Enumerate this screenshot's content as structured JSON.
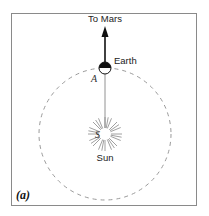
{
  "figure": {
    "panel_label": "(a)",
    "direction_label": "To Mars",
    "earth_label": "Earth",
    "sun_label": "Sun",
    "point_a_label": "A",
    "point_s_label": "S"
  },
  "colors": {
    "frame": "#8a8a8a",
    "orbit": "#9a9a9a",
    "arrow": "#111111",
    "sun_rays": "#888888"
  }
}
